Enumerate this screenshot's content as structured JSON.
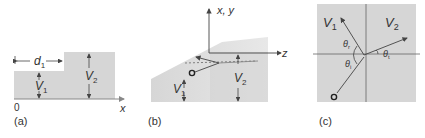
{
  "colors": {
    "fill": "#d6d6d6",
    "line": "#444444",
    "axis": "#888888",
    "text": "#333333"
  },
  "panel_a": {
    "caption": "(a)",
    "origin_label": "0",
    "x_axis_label": "x",
    "d1_label": "d",
    "d1_sub": "1",
    "v1_label": "V",
    "v1_sub": "1",
    "v2_label": "V",
    "v2_sub": "2"
  },
  "panel_b": {
    "caption": "(b)",
    "vertical_axis_label": "x, y",
    "horizontal_axis_label": "z",
    "v1_label": "V",
    "v1_sub": "1",
    "v2_label": "V",
    "v2_sub": "2"
  },
  "panel_c": {
    "caption": "(c)",
    "v1_label": "V",
    "v1_sub": "1",
    "v2_label": "V",
    "v2_sub": "2",
    "theta_r": "θ",
    "theta_r_sub": "r",
    "theta_i": "θ",
    "theta_i_sub": "i",
    "theta_t": "θ",
    "theta_t_sub": "t"
  }
}
